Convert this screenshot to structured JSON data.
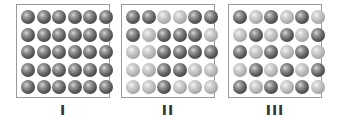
{
  "figure": {
    "legend": {
      "D": "dark sphere",
      "L": "light sphere"
    },
    "colors": {
      "dark": "#4a4a4a",
      "light": "#bdbdbd",
      "border": "#9a9a9a",
      "label": "#333333"
    },
    "panels": [
      {
        "label": "I",
        "rows": [
          [
            "D",
            "D",
            "D",
            "D",
            "D",
            "D"
          ],
          [
            "D",
            "D",
            "D",
            "D",
            "D",
            "D"
          ],
          [
            "D",
            "D",
            "D",
            "D",
            "D",
            "D"
          ],
          [
            "D",
            "D",
            "D",
            "D",
            "D",
            "D"
          ],
          [
            "D",
            "D",
            "D",
            "D",
            "D",
            "D"
          ]
        ]
      },
      {
        "label": "II",
        "rows": [
          [
            "D",
            "D",
            "L",
            "L",
            "D",
            "D"
          ],
          [
            "D",
            "L",
            "D",
            "D",
            "D",
            "L"
          ],
          [
            "L",
            "L",
            "D",
            "D",
            "D",
            "D"
          ],
          [
            "L",
            "L",
            "D",
            "D",
            "L",
            "L"
          ],
          [
            "L",
            "L",
            "D",
            "L",
            "L",
            "L"
          ]
        ]
      },
      {
        "label": "III",
        "rows": [
          [
            "D",
            "L",
            "D",
            "L",
            "D",
            "L"
          ],
          [
            "L",
            "D",
            "L",
            "D",
            "L",
            "D"
          ],
          [
            "D",
            "L",
            "D",
            "L",
            "D",
            "L"
          ],
          [
            "L",
            "D",
            "L",
            "D",
            "L",
            "D"
          ],
          [
            "D",
            "L",
            "D",
            "L",
            "D",
            "L"
          ]
        ]
      }
    ]
  }
}
